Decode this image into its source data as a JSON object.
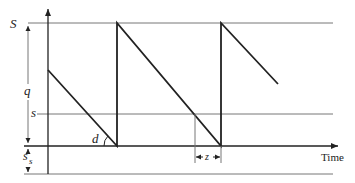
{
  "diagram": {
    "labels": {
      "max_level": "S",
      "order_quantity": "q",
      "reorder_point": "s",
      "safety_stock_main": "s",
      "safety_stock_sub": "s",
      "demand_rate": "d",
      "lead_time": "z",
      "x_axis": "Time"
    },
    "colors": {
      "stroke": "#222222",
      "guide": "#777777",
      "background": "#ffffff"
    },
    "levels": {
      "S_y": 23,
      "s_y": 114,
      "zero_y": 146,
      "bottom_y": 174
    },
    "sawtooth_points": [
      [
        48,
        70
      ],
      [
        117,
        146
      ],
      [
        117,
        23
      ],
      [
        221,
        146
      ],
      [
        221,
        23
      ],
      [
        278,
        84
      ]
    ]
  }
}
